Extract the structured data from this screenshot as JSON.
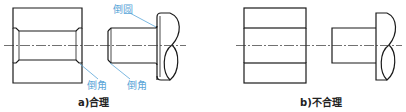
{
  "figure": {
    "panel_a": {
      "caption": "a)合理",
      "labels": {
        "fillet": "倒圆",
        "chamfer_hole": "倒角",
        "chamfer_shaft": "倒角"
      }
    },
    "panel_b": {
      "caption": "b)不合理"
    }
  },
  "colors": {
    "label": "#5ba6d8",
    "line": "#1a1a1a",
    "hatch": "#555555"
  }
}
